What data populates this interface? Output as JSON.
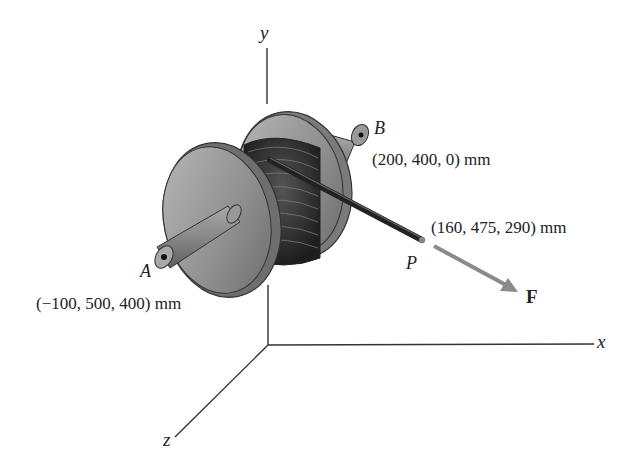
{
  "figure": {
    "axes": {
      "x": "x",
      "y": "y",
      "z": "z"
    },
    "points": {
      "A": {
        "label": "A",
        "coords": "(−100, 500, 400) mm"
      },
      "B": {
        "label": "B",
        "coords": "(200, 400, 0) mm"
      },
      "P": {
        "label": "P",
        "coords": "(160, 475, 290) mm"
      }
    },
    "force": {
      "label": "F"
    },
    "colors": {
      "line": "#333333",
      "spool": "#8c8c8c",
      "cable": "#2a2a2a",
      "force_arrow": "#8a8a8a"
    }
  }
}
